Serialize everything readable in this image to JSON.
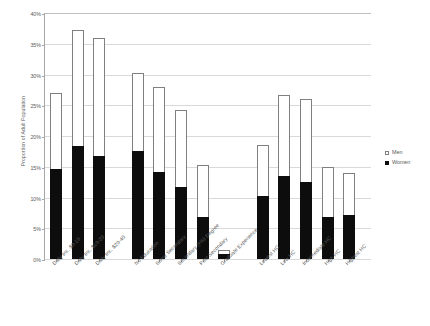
{
  "chart_data": {
    "type": "bar",
    "title": "",
    "subtitle": "",
    "xlabel": "",
    "ylabel": "Proportion of Adult Population",
    "ylim": [
      0,
      40
    ],
    "ytick_labels": [
      "0%",
      "5%",
      "10%",
      "15%",
      "20%",
      "25%",
      "30%",
      "35%",
      "40%"
    ],
    "ytick_values": [
      0,
      5,
      10,
      15,
      20,
      25,
      30,
      35,
      40
    ],
    "grid": true,
    "stacked_overlay": true,
    "legend_position": "right",
    "categories": [
      "Daily Inc. $0-10",
      "Daily Inc. $10-20",
      "Daily Inc. $20-40",
      "No Education",
      "Some Secondary",
      "Secondary (HS) Degree",
      "Post Secondary",
      "Graduate Experience",
      "Lowest HC",
      "Low HC",
      "Intermediate HC",
      "High HC",
      "Highest HC"
    ],
    "group_breaks_after": [
      2,
      7
    ],
    "series": [
      {
        "name": "Men",
        "values": [
          27.0,
          37.2,
          36.0,
          30.2,
          28.0,
          24.3,
          15.3,
          1.5,
          18.5,
          26.7,
          26.0,
          15.0,
          14.0
        ]
      },
      {
        "name": "Women",
        "values": [
          14.6,
          18.3,
          16.8,
          17.5,
          14.2,
          11.7,
          6.9,
          0.8,
          10.3,
          13.5,
          12.5,
          6.8,
          7.2
        ]
      }
    ],
    "colors": {
      "men": "#ffffff",
      "men_border": "#808080",
      "women": "#0d0d0d",
      "gridline": "#d9d9d9",
      "axis": "#a6a6a6",
      "text": "#595959"
    }
  },
  "legend": {
    "items": [
      {
        "label": "Men",
        "swatch": "hollow-square"
      },
      {
        "label": "Women",
        "swatch": "filled-square"
      }
    ]
  }
}
